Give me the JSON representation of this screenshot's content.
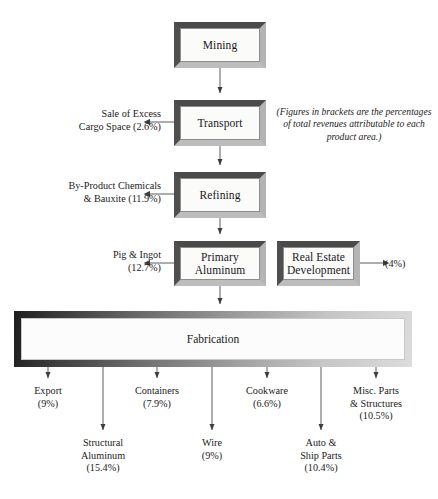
{
  "diagram": {
    "note": "(Figures in brackets are the\npercentages of total revenues\nattributable to each product area.)",
    "nodes": {
      "mining": "Mining",
      "transport": "Transport",
      "refining": "Refining",
      "primary_aluminum": "Primary\nAluminum",
      "real_estate": "Real Estate\nDevelopment",
      "fabrication": "Fabrication"
    },
    "side_outputs": [
      {
        "key": "cargo",
        "label": "Sale of Excess\nCargo Space (2.6%)",
        "percent": "2.6%"
      },
      {
        "key": "byproduct",
        "label": "By-Product Chemicals\n& Bauxite (11.9%)",
        "percent": "11.9%"
      },
      {
        "key": "pig",
        "label": "Pig & Ingot\n(12.7%)",
        "percent": "12.7%"
      },
      {
        "key": "realestate",
        "label": "(4%)",
        "percent": "4%"
      }
    ],
    "fabrication_outputs": [
      {
        "key": "export",
        "label": "Export\n(9%)",
        "percent": "9%"
      },
      {
        "key": "structural",
        "label": "Structural\nAluminum\n(15.4%)",
        "percent": "15.4%"
      },
      {
        "key": "containers",
        "label": "Containers\n(7.9%)",
        "percent": "7.9%"
      },
      {
        "key": "wire",
        "label": "Wire\n(9%)",
        "percent": "9%"
      },
      {
        "key": "cookware",
        "label": "Cookware\n(6.6%)",
        "percent": "6.6%"
      },
      {
        "key": "auto",
        "label": "Auto &\nShip Parts\n(10.4%)",
        "percent": "10.4%"
      },
      {
        "key": "misc",
        "label": "Misc. Parts\n& Structures\n(10.5%)",
        "percent": "10.5%"
      }
    ],
    "colors": {
      "background": "#ffffff",
      "text": "#1b1b1b",
      "box_fill": "#fbfbfa",
      "frame_dark": "#4a4a4a",
      "frame_light": "#bdbdbd",
      "connector": "#6b6b6b"
    }
  }
}
